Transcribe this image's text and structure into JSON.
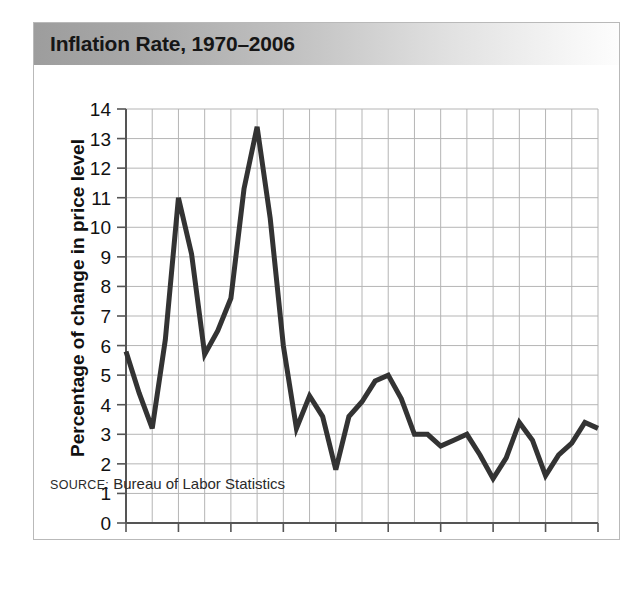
{
  "figure": {
    "title": "Inflation Rate, 1970–2006",
    "source_prefix": "SOURCE:",
    "source_text": " Bureau of Labor Statistics",
    "border_color": "#b9b9b9",
    "line_color": "#333333",
    "grid_color": "#b5b5b5",
    "axis_color": "#555555"
  },
  "chart_data": {
    "type": "line",
    "title": "Inflation Rate, 1970–2006",
    "xlabel": "",
    "ylabel": "Percentage of change in price level",
    "xlim": [
      1970,
      2006
    ],
    "ylim": [
      0,
      14
    ],
    "grid": true,
    "legend": null,
    "ytick_labels": [
      "14",
      "13",
      "12",
      "11",
      "10",
      "9",
      "8",
      "7",
      "6",
      "5",
      "4",
      "3",
      "2",
      "1",
      "0"
    ],
    "ytick_values": [
      14,
      13,
      12,
      11,
      10,
      9,
      8,
      7,
      6,
      5,
      4,
      3,
      2,
      1,
      0
    ],
    "xtick_labels": [
      "1970",
      "1974",
      "1978",
      "1982",
      "1986",
      "1990",
      "1994",
      "1998",
      "2002",
      "2006"
    ],
    "xtick_values": [
      1970,
      1974,
      1978,
      1982,
      1986,
      1990,
      1994,
      1998,
      2002,
      2006
    ],
    "x": [
      1970,
      1971,
      1972,
      1973,
      1974,
      1975,
      1976,
      1977,
      1978,
      1979,
      1980,
      1981,
      1982,
      1983,
      1984,
      1985,
      1986,
      1987,
      1988,
      1989,
      1990,
      1991,
      1992,
      1993,
      1994,
      1995,
      1996,
      1997,
      1998,
      1999,
      2000,
      2001,
      2002,
      2003,
      2004,
      2005,
      2006
    ],
    "values": [
      5.8,
      4.4,
      3.2,
      6.2,
      11.0,
      9.1,
      5.7,
      6.5,
      7.6,
      11.3,
      13.4,
      10.3,
      6.0,
      3.2,
      4.3,
      3.6,
      1.8,
      3.6,
      4.1,
      4.8,
      5.0,
      4.2,
      3.0,
      3.0,
      2.6,
      2.8,
      3.0,
      2.3,
      1.5,
      2.2,
      3.4,
      2.8,
      1.6,
      2.3,
      2.7,
      3.4,
      3.2
    ],
    "series": [
      {
        "name": "Inflation rate",
        "values": [
          5.8,
          4.4,
          3.2,
          6.2,
          11.0,
          9.1,
          5.7,
          6.5,
          7.6,
          11.3,
          13.4,
          10.3,
          6.0,
          3.2,
          4.3,
          3.6,
          1.8,
          3.6,
          4.1,
          4.8,
          5.0,
          4.2,
          3.0,
          3.0,
          2.6,
          2.8,
          3.0,
          2.3,
          1.5,
          2.2,
          3.4,
          2.8,
          1.6,
          2.3,
          2.7,
          3.4,
          3.2
        ]
      }
    ]
  }
}
